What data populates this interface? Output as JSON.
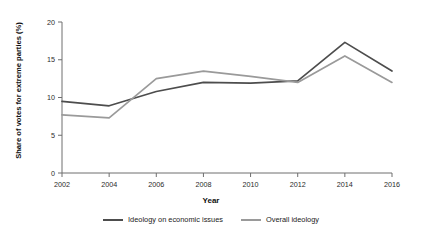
{
  "chart_data": {
    "type": "line",
    "title": "",
    "xlabel": "Year",
    "ylabel": "Share of votes for extreme parties (%)",
    "x": [
      2002,
      2004,
      2006,
      2008,
      2010,
      2012,
      2014,
      2016
    ],
    "xticklabels": [
      "2002",
      "2004",
      "2006",
      "2008",
      "2010",
      "2012",
      "2014",
      "2016"
    ],
    "yticks": [
      0,
      5,
      10,
      15,
      20
    ],
    "yticklabels": [
      "0",
      "5",
      "10",
      "15",
      "20"
    ],
    "xlim": [
      2002,
      2016
    ],
    "ylim": [
      0,
      20
    ],
    "grid": false,
    "legend_position": "bottom-center",
    "series": [
      {
        "name": "Ideology on economic issues",
        "color": "#4d4d4d",
        "values": [
          9.5,
          8.9,
          10.8,
          12.0,
          11.9,
          12.2,
          17.3,
          13.5
        ]
      },
      {
        "name": "Overall ideology",
        "color": "#9a9a9a",
        "values": [
          7.7,
          7.3,
          12.5,
          13.5,
          12.8,
          12.0,
          15.5,
          12.0
        ]
      }
    ]
  },
  "axes": {
    "y_title": "Share of votes for extreme parties (%)",
    "x_title": "Year"
  },
  "legend": {
    "items": [
      {
        "label": "Ideology on economic issues",
        "color": "#4d4d4d"
      },
      {
        "label": "Overall ideology",
        "color": "#9a9a9a"
      }
    ]
  },
  "colors": {
    "axis": "#6e6e6e",
    "text": "#1a1a1a",
    "background": "#ffffff",
    "series_dark": "#4d4d4d",
    "series_light": "#9a9a9a"
  }
}
